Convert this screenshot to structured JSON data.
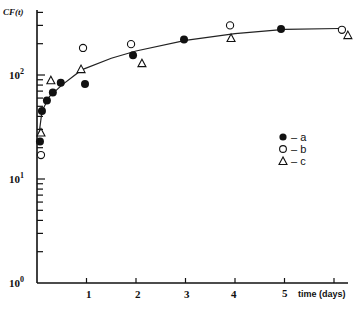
{
  "chart_data": {
    "type": "scatter",
    "title": "",
    "xlabel": "time (days)",
    "ylabel": "CF(t)",
    "yscale": "log",
    "ylim": [
      1,
      400
    ],
    "xlim": [
      0,
      6.3
    ],
    "x_ticks": [
      "1",
      "2",
      "3",
      "4",
      "5",
      ""
    ],
    "y_ticks": [
      "10^0",
      "10^1",
      "10^2"
    ],
    "grid": false,
    "legend_position": "right-middle",
    "series": [
      {
        "name": "a",
        "marker": "filled-circle",
        "x": [
          0.06,
          0.1,
          0.2,
          0.32,
          0.48,
          0.97,
          1.94,
          2.97,
          4.93
        ],
        "y": [
          23,
          45,
          57,
          68,
          84,
          82,
          155,
          220,
          277
        ]
      },
      {
        "name": "b",
        "marker": "open-circle",
        "x": [
          0.08,
          0.93,
          1.9,
          3.9,
          6.16
        ],
        "y": [
          17,
          182,
          198,
          300,
          272
        ]
      },
      {
        "name": "c",
        "marker": "open-triangle",
        "x": [
          0.08,
          0.28,
          0.89,
          2.12,
          3.92,
          6.28
        ],
        "y": [
          28,
          89,
          114,
          130,
          227,
          242
        ]
      }
    ],
    "fit_curve": {
      "x": [
        0.04,
        0.1,
        0.25,
        0.5,
        0.9,
        1.5,
        2,
        3,
        4,
        5,
        6.1
      ],
      "y": [
        27,
        45,
        62,
        80,
        112,
        145,
        170,
        215,
        250,
        275,
        280
      ]
    }
  },
  "labels": {
    "ylabel": "CF(t)",
    "xlabel": "time (days)",
    "y_base": "10",
    "y_exps": [
      "0",
      "1",
      "2"
    ],
    "x_ticks": [
      "1",
      "2",
      "3",
      "4",
      "5"
    ],
    "legend": [
      {
        "marker": "filled-circle",
        "label": "– a"
      },
      {
        "marker": "open-circle",
        "label": "– b"
      },
      {
        "marker": "open-triangle",
        "label": "– c"
      }
    ]
  }
}
